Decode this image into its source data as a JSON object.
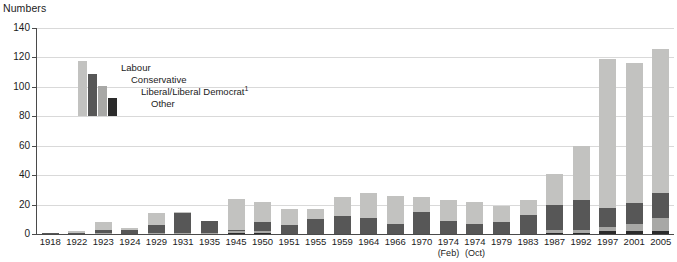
{
  "chart_data": {
    "type": "bar",
    "subtype": "stacked-vertical",
    "title": "",
    "ylabel": "Numbers",
    "xlabel": "",
    "ylim": [
      0,
      140
    ],
    "yticks": [
      0,
      20,
      40,
      60,
      80,
      100,
      120,
      140
    ],
    "grid": "horizontal",
    "legend_position": "top-left",
    "footnote_marker": "1",
    "categories": [
      "1918",
      "1922",
      "1923",
      "1924",
      "1929",
      "1931",
      "1935",
      "1945",
      "1950",
      "1951",
      "1955",
      "1959",
      "1964",
      "1966",
      "1970",
      "1974",
      "1974",
      "1979",
      "1983",
      "1987",
      "1992",
      "1997",
      "2001",
      "2005"
    ],
    "category_sublabels": [
      "",
      "",
      "",
      "",
      "",
      "",
      "",
      "",
      "",
      "",
      "",
      "",
      "",
      "",
      "",
      "(Feb)",
      "(Oct)",
      "",
      "",
      "",
      "",
      "",
      "",
      ""
    ],
    "series": [
      {
        "name": "Other",
        "color": "#2b2b2b",
        "values": [
          0,
          0,
          0,
          0,
          0,
          0,
          0,
          1,
          1,
          0,
          0,
          0,
          0,
          0,
          0,
          0,
          0,
          0,
          0,
          1,
          1,
          2,
          2,
          2
        ]
      },
      {
        "name": "Liberal/Liberal Democrat",
        "color": "#a8a8a6",
        "values": [
          0,
          0,
          1,
          0,
          1,
          1,
          1,
          1,
          1,
          0,
          0,
          0,
          0,
          0,
          0,
          0,
          0,
          0,
          0,
          2,
          2,
          3,
          5,
          9
        ]
      },
      {
        "name": "Conservative",
        "color": "#575757",
        "values": [
          1,
          1,
          2,
          3,
          5,
          13,
          8,
          1,
          6,
          6,
          10,
          12,
          11,
          7,
          15,
          9,
          7,
          8,
          13,
          17,
          20,
          13,
          14,
          17
        ]
      },
      {
        "name": "Labour",
        "color": "#c2c2c0",
        "values": [
          0,
          1,
          5,
          1,
          8,
          1,
          0,
          21,
          14,
          11,
          7,
          13,
          17,
          19,
          10,
          14,
          15,
          11,
          10,
          21,
          37,
          101,
          95,
          98
        ]
      }
    ],
    "totals": [
      1,
      2,
      8,
      4,
      14,
      15,
      9,
      24,
      22,
      17,
      17,
      25,
      28,
      26,
      25,
      23,
      22,
      19,
      23,
      41,
      60,
      119,
      116,
      126
    ],
    "legend_entries": [
      {
        "label": "Labour",
        "color": "#c2c2c0"
      },
      {
        "label": "Conservative",
        "color": "#575757"
      },
      {
        "label": "Liberal/Liberal Democrat",
        "superscript": "1",
        "color": "#a8a8a6"
      },
      {
        "label": "Other",
        "color": "#2b2b2b"
      }
    ]
  }
}
